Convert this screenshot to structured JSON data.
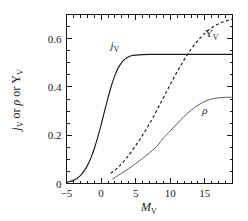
{
  "chart_data": {
    "type": "line",
    "title": "",
    "xlabel": "M_V",
    "ylabel": "j_V or ρ or Υ_V",
    "xlim": [
      -5,
      19
    ],
    "ylim": [
      0,
      0.7
    ],
    "grid": false,
    "legend": "inline-curve-labels",
    "xticks": [
      -5,
      0,
      5,
      10,
      15
    ],
    "xticklabels": [
      "−5",
      "0",
      "5",
      "10",
      "15"
    ],
    "xminor_step": 1,
    "yticks": [
      0,
      0.2,
      0.4,
      0.6
    ],
    "yticklabels": [
      "0",
      "0.2",
      "0.4",
      "0.6"
    ],
    "yminor_step": 0.05,
    "series": [
      {
        "name": "j_V",
        "label": "j",
        "label_sub": "V",
        "style": "solid",
        "color": "#1a1a1a",
        "label_x": 2.0,
        "label_y": 0.575,
        "x": [
          -5,
          -4.5,
          -4,
          -3.5,
          -3,
          -2.5,
          -2,
          -1.5,
          -1,
          -0.5,
          0,
          0.5,
          1,
          1.5,
          2,
          2.5,
          3,
          3.5,
          4,
          4.5,
          5,
          6,
          7,
          8,
          10,
          12,
          14,
          16,
          19
        ],
        "y": [
          0.004,
          0.008,
          0.013,
          0.021,
          0.033,
          0.05,
          0.073,
          0.104,
          0.143,
          0.19,
          0.243,
          0.3,
          0.355,
          0.406,
          0.448,
          0.48,
          0.502,
          0.516,
          0.525,
          0.53,
          0.532,
          0.534,
          0.535,
          0.535,
          0.535,
          0.535,
          0.535,
          0.535,
          0.535
        ]
      },
      {
        "name": "Upsilon_V",
        "label": "Υ",
        "label_sub": "V",
        "style": "dashed",
        "color": "#1a1a1a",
        "label_x": 16.0,
        "label_y": 0.625,
        "x": [
          1.4,
          2,
          2.5,
          3,
          3.5,
          4,
          5,
          6,
          7,
          8,
          9,
          10,
          11,
          12,
          13,
          14,
          15,
          16,
          17,
          18,
          19
        ],
        "y": [
          0.042,
          0.055,
          0.068,
          0.083,
          0.099,
          0.117,
          0.157,
          0.2,
          0.248,
          0.3,
          0.355,
          0.41,
          0.463,
          0.512,
          0.556,
          0.592,
          0.622,
          0.645,
          0.662,
          0.673,
          0.681
        ]
      },
      {
        "name": "rho",
        "label": "ρ",
        "label_sub": "",
        "style": "thin",
        "color": "#5d5d5d",
        "label_x": 15.0,
        "label_y": 0.305,
        "x": [
          1.6,
          2,
          3,
          4,
          5,
          6,
          7,
          8,
          8.6,
          9,
          10,
          11,
          12,
          13,
          14,
          15,
          16,
          17,
          18,
          19
        ],
        "y": [
          0.018,
          0.025,
          0.043,
          0.062,
          0.082,
          0.104,
          0.127,
          0.152,
          0.174,
          0.188,
          0.218,
          0.248,
          0.278,
          0.303,
          0.324,
          0.34,
          0.35,
          0.355,
          0.357,
          0.357
        ]
      }
    ]
  },
  "axis": {
    "ylabel_parts": {
      "j": "j",
      "j_sub": "V",
      "or1": " or ",
      "rho": "ρ",
      "or2": " or ",
      "upsilon": "Υ",
      "ups_sub": "V"
    },
    "xlabel_parts": {
      "m": "M",
      "m_sub": "V"
    }
  }
}
